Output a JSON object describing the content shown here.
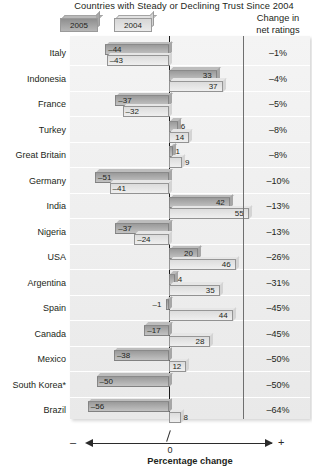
{
  "title": "Countries with Steady or Declining Trust Since 2004",
  "legend": [
    {
      "label": "2005",
      "key": "y2005"
    },
    {
      "label": "2004",
      "key": "y2004"
    }
  ],
  "right_column_header_line1": "Change in",
  "right_column_header_line2": "net ratings",
  "axis": {
    "negative_sign": "–",
    "positive_sign": "+",
    "zero_label": "0",
    "title": "Percentage change"
  },
  "chart_data": {
    "type": "bar",
    "title": "Countries with Steady or Declining Trust Since 2004",
    "xlabel": "Percentage change",
    "ylabel": "",
    "orientation": "horizontal",
    "grid": false,
    "legend_position": "top-left",
    "xlim": [
      -60,
      60
    ],
    "categories": [
      "Italy",
      "Indonesia",
      "France",
      "Turkey",
      "Great Britain",
      "Germany",
      "India",
      "Nigeria",
      "USA",
      "Argentina",
      "Spain",
      "Canada",
      "Mexico",
      "South Korea*",
      "Brazil"
    ],
    "series": [
      {
        "name": "2005",
        "values": [
          -44,
          33,
          -37,
          6,
          1,
          -51,
          42,
          -37,
          20,
          4,
          -1,
          -17,
          -38,
          -50,
          -56
        ]
      },
      {
        "name": "2004",
        "values": [
          -43,
          37,
          -32,
          14,
          9,
          -41,
          55,
          -24,
          46,
          35,
          44,
          28,
          12,
          0,
          8
        ]
      }
    ],
    "annotations_column": {
      "header": "Change in net ratings",
      "values": [
        "–1%",
        "–4%",
        "–5%",
        "–8%",
        "–8%",
        "–10%",
        "–13%",
        "–13%",
        "–26%",
        "–31%",
        "–45%",
        "–45%",
        "–50%",
        "–50%",
        "–64%"
      ]
    }
  },
  "rows": [
    {
      "country": "Italy",
      "v2005": "–44",
      "v2004": "–43",
      "n2005": -44,
      "n2004": -43,
      "pct": "–1%"
    },
    {
      "country": "Indonesia",
      "v2005": "33",
      "v2004": "37",
      "n2005": 33,
      "n2004": 37,
      "pct": "–4%"
    },
    {
      "country": "France",
      "v2005": "–37",
      "v2004": "–32",
      "n2005": -37,
      "n2004": -32,
      "pct": "–5%"
    },
    {
      "country": "Turkey",
      "v2005": "6",
      "v2004": "14",
      "n2005": 6,
      "n2004": 14,
      "pct": "–8%"
    },
    {
      "country": "Great Britain",
      "v2005": "1",
      "v2004": "9",
      "n2005": 1,
      "n2004": 9,
      "pct": "–8%"
    },
    {
      "country": "Germany",
      "v2005": "–51",
      "v2004": "–41",
      "n2005": -51,
      "n2004": -41,
      "pct": "–10%"
    },
    {
      "country": "India",
      "v2005": "42",
      "v2004": "55",
      "n2005": 42,
      "n2004": 55,
      "pct": "–13%"
    },
    {
      "country": "Nigeria",
      "v2005": "–37",
      "v2004": "–24",
      "n2005": -37,
      "n2004": -24,
      "pct": "–13%"
    },
    {
      "country": "USA",
      "v2005": "20",
      "v2004": "46",
      "n2005": 20,
      "n2004": 46,
      "pct": "–26%"
    },
    {
      "country": "Argentina",
      "v2005": "4",
      "v2004": "35",
      "n2005": 4,
      "n2004": 35,
      "pct": "–31%"
    },
    {
      "country": "Spain",
      "v2005": "–1",
      "v2004": "44",
      "n2005": -1,
      "n2004": 44,
      "pct": "–45%"
    },
    {
      "country": "Canada",
      "v2005": "–17",
      "v2004": "28",
      "n2005": -17,
      "n2004": 28,
      "pct": "–45%"
    },
    {
      "country": "Mexico",
      "v2005": "–38",
      "v2004": "12",
      "n2005": -38,
      "n2004": 12,
      "pct": "–50%"
    },
    {
      "country": "South Korea*",
      "v2005": "–50",
      "v2004": "",
      "n2005": -50,
      "n2004": 0,
      "pct": "–50%"
    },
    {
      "country": "Brazil",
      "v2005": "–56",
      "v2004": "8",
      "n2005": -56,
      "n2004": 8,
      "pct": "–64%"
    }
  ]
}
